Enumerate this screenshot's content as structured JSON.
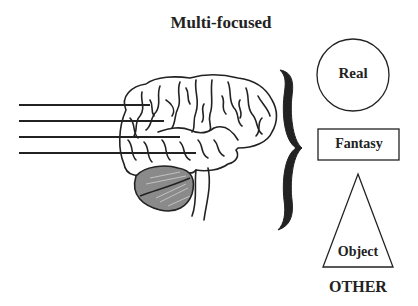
{
  "title": "Multi-focused",
  "brain": {
    "input_lines": 4
  },
  "categories": [
    {
      "shape": "circle",
      "label": "Real"
    },
    {
      "shape": "rectangle",
      "label": "Fantasy"
    },
    {
      "shape": "triangle",
      "label": "Object"
    }
  ],
  "footer_label": "OTHER",
  "colors": {
    "ink": "#222222",
    "cerebellum": "#8a8a8a",
    "background": "#ffffff"
  }
}
